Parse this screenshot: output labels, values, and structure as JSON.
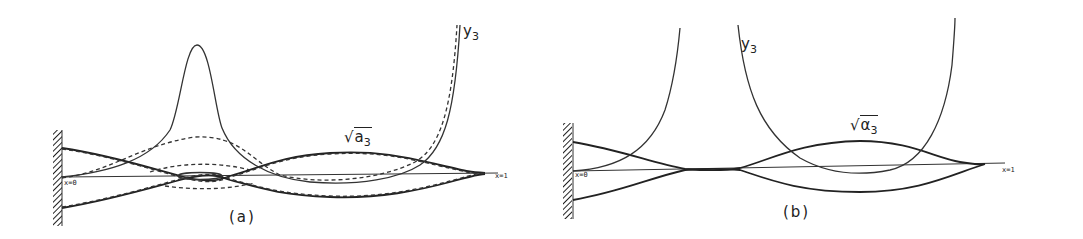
{
  "panels": [
    {
      "id": "a",
      "caption": "(a)",
      "curve_label_y": "y",
      "curve_label_y_sub": "3",
      "curve_label_alpha": "a",
      "curve_label_alpha_sub": "3",
      "curve_label_alpha_root": "√",
      "x_start_label": "x=0",
      "x_end_label": "x=1",
      "line_styles": [
        "solid",
        "dashed"
      ]
    },
    {
      "id": "b",
      "caption": "(b)",
      "curve_label_y": "y",
      "curve_label_y_sub": "3",
      "curve_label_alpha": "α",
      "curve_label_alpha_sub": "3",
      "curve_label_alpha_root": "√",
      "x_start_label": "x=0",
      "x_end_label": "x=1",
      "line_styles": [
        "solid"
      ]
    }
  ],
  "colors": {
    "ink": "#222222",
    "background": "#ffffff"
  }
}
